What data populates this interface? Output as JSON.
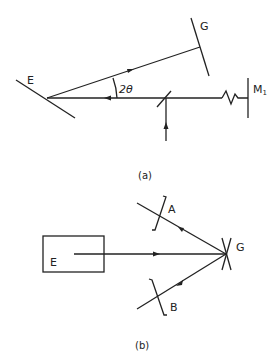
{
  "figure_a": {
    "labels": {
      "E": "E",
      "G": "G",
      "angle": "2θ",
      "M1": "M",
      "M1_sub": "1"
    },
    "caption": "(a)"
  },
  "figure_b": {
    "labels": {
      "E": "E",
      "G": "G",
      "A": "A",
      "B": "B"
    },
    "caption": "(b)"
  }
}
